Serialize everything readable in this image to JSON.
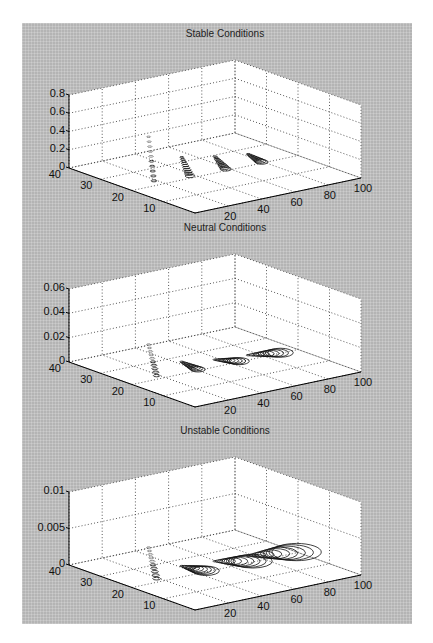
{
  "chart_data": [
    {
      "type": "contour3",
      "title": "Stable Conditions",
      "xlabel": "",
      "ylabel": "",
      "zlabel": "",
      "x_ticks": [
        "20",
        "40",
        "60",
        "80",
        "100"
      ],
      "y_ticks": [
        "10",
        "20",
        "30",
        "40"
      ],
      "z_ticks": [
        "0",
        "0.2",
        "0.4",
        "0.6",
        "0.8"
      ],
      "xlim": [
        0,
        100
      ],
      "ylim": [
        0,
        40
      ],
      "zlim": [
        0,
        0.8
      ],
      "grid": true,
      "plumes": [
        {
          "x": 10,
          "y": 20,
          "peak": 0.55
        },
        {
          "x": 30,
          "y": 20,
          "peak": 0.25
        },
        {
          "x": 50,
          "y": 20,
          "peak": 0.18
        },
        {
          "x": 70,
          "y": 20,
          "peak": 0.13
        }
      ]
    },
    {
      "type": "contour3",
      "title": "Neutral Conditions",
      "xlabel": "",
      "ylabel": "",
      "zlabel": "",
      "x_ticks": [
        "20",
        "40",
        "60",
        "80",
        "100"
      ],
      "y_ticks": [
        "10",
        "20",
        "30",
        "40"
      ],
      "z_ticks": [
        "0",
        "0.02",
        "0.04",
        "0.06"
      ],
      "xlim": [
        0,
        100
      ],
      "ylim": [
        0,
        40
      ],
      "zlim": [
        0,
        0.06
      ],
      "grid": true,
      "plumes": [
        {
          "x": 10,
          "y": 20,
          "peak": 0.03
        },
        {
          "x": 30,
          "y": 20,
          "peak": 0.01
        },
        {
          "x": 50,
          "y": 20,
          "peak": 0.006
        },
        {
          "x": 70,
          "y": 20,
          "peak": 0.004
        }
      ]
    },
    {
      "type": "contour3",
      "title": "Unstable Conditions",
      "xlabel": "",
      "ylabel": "",
      "zlabel": "",
      "x_ticks": [
        "20",
        "40",
        "60",
        "80",
        "100"
      ],
      "y_ticks": [
        "10",
        "20",
        "30",
        "40"
      ],
      "z_ticks": [
        "0",
        "0.005",
        "0.01"
      ],
      "xlim": [
        0,
        100
      ],
      "ylim": [
        0,
        40
      ],
      "zlim": [
        0,
        0.01
      ],
      "grid": true,
      "plumes": [
        {
          "x": 10,
          "y": 20,
          "peak": 0.005
        },
        {
          "x": 30,
          "y": 20,
          "peak": 0.0015
        },
        {
          "x": 50,
          "y": 20,
          "peak": 0.0012
        },
        {
          "x": 70,
          "y": 20,
          "peak": 0.001
        }
      ]
    }
  ],
  "panels": [
    {
      "title": "Stable Conditions"
    },
    {
      "title": "Neutral Conditions"
    },
    {
      "title": "Unstable Conditions"
    }
  ]
}
